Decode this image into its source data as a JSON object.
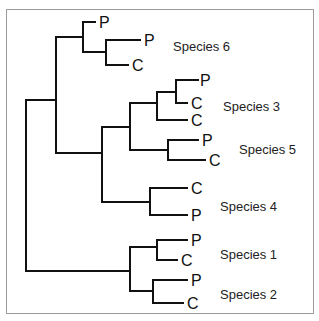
{
  "diagram": {
    "type": "phylogenetic-tree",
    "colors": {
      "line": "#111111",
      "frame": "#9a9a9a",
      "background": "#ffffff"
    },
    "tips": [
      {
        "label": "P",
        "group": "Species 6"
      },
      {
        "label": "P",
        "group": "Species 6"
      },
      {
        "label": "C",
        "group": "Species 6"
      },
      {
        "label": "P",
        "group": "Species 3"
      },
      {
        "label": "C",
        "group": "Species 3"
      },
      {
        "label": "C",
        "group": "Species 3"
      },
      {
        "label": "P",
        "group": "Species 5"
      },
      {
        "label": "C",
        "group": "Species 5"
      },
      {
        "label": "C",
        "group": "Species 4"
      },
      {
        "label": "P",
        "group": "Species 4"
      },
      {
        "label": "P",
        "group": "Species 1"
      },
      {
        "label": "C",
        "group": "Species 1"
      },
      {
        "label": "P",
        "group": "Species 2"
      },
      {
        "label": "C",
        "group": "Species 2"
      }
    ],
    "species_labels": [
      "Species 6",
      "Species 3",
      "Species 5",
      "Species 4",
      "Species 1",
      "Species 2"
    ]
  }
}
